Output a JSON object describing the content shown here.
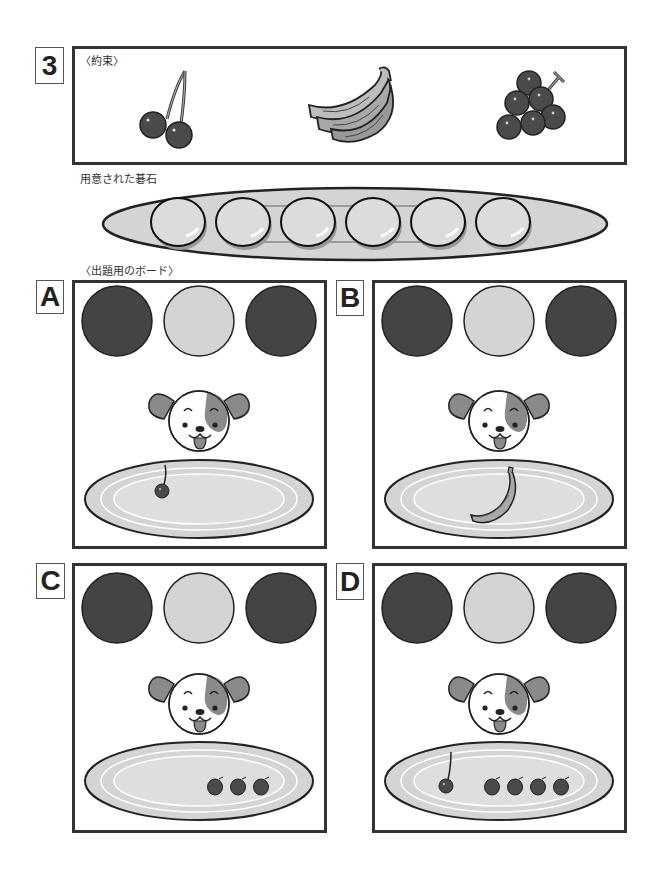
{
  "problem": {
    "number": "3",
    "rule_caption": "〈約束〉",
    "rule_items": [
      {
        "fruit": "cherry",
        "icon": "cherry-icon"
      },
      {
        "fruit": "banana",
        "icon": "banana-icon"
      },
      {
        "fruit": "grapes",
        "icon": "grapes-icon"
      }
    ]
  },
  "stones_section": {
    "caption": "用意された碁石",
    "stone_count": 6,
    "tray_icon": "stone-tray-icon"
  },
  "boards_section": {
    "caption": "〈出題用のボード〉",
    "boards": [
      {
        "label": "A",
        "circles": [
          "dark",
          "light",
          "dark"
        ],
        "plate_contents": [
          {
            "fruit": "cherry",
            "count": 1
          }
        ]
      },
      {
        "label": "B",
        "circles": [
          "dark",
          "light",
          "dark"
        ],
        "plate_contents": [
          {
            "fruit": "banana",
            "count": 1
          }
        ]
      },
      {
        "label": "C",
        "circles": [
          "dark",
          "light",
          "dark"
        ],
        "plate_contents": [
          {
            "fruit": "grape",
            "count": 3
          }
        ]
      },
      {
        "label": "D",
        "circles": [
          "dark",
          "light",
          "dark"
        ],
        "plate_contents": [
          {
            "fruit": "cherry",
            "count": 1
          },
          {
            "fruit": "grape",
            "count": 4
          }
        ]
      }
    ]
  },
  "colors": {
    "dark_circle": "#444444",
    "light_circle": "#d4d4d4",
    "plate": "#d6d6d6",
    "stone": "#d8d8d8",
    "fruit_dark": "#4a4a4a",
    "dog_patch": "#8a8a8a",
    "frame": "#333333"
  }
}
